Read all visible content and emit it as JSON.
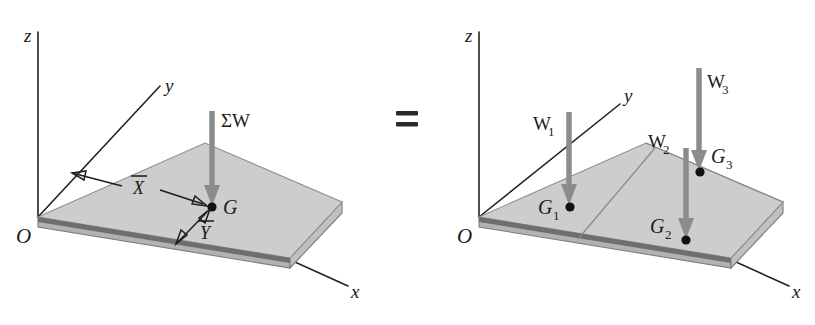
{
  "figure": {
    "caption_equals": "=",
    "left_diagram": {
      "name": "resultant-weight-diagram",
      "axes": {
        "x": "x",
        "y": "y",
        "z": "z",
        "origin": "O"
      },
      "centroid_label": "G",
      "force_label": "ΣW",
      "dimension_x_label": "X",
      "dimension_y_label": "Y",
      "dimension_x_overbar": true,
      "dimension_y_overbar": true
    },
    "right_diagram": {
      "name": "component-weights-diagram",
      "axes": {
        "x": "x",
        "y": "y",
        "z": "z",
        "origin": "O"
      },
      "forces": [
        {
          "label": "W",
          "sub": "1"
        },
        {
          "label": "W",
          "sub": "2"
        },
        {
          "label": "W",
          "sub": "3"
        }
      ],
      "centroids": [
        {
          "label": "G",
          "sub": "1"
        },
        {
          "label": "G",
          "sub": "2"
        },
        {
          "label": "G",
          "sub": "3"
        }
      ]
    },
    "colors": {
      "plate_top": "#cdcdcd",
      "plate_front": "#b2b2b2",
      "plate_right": "#c0c0c0",
      "arrow_gray": "#8c8c8c",
      "ink": "#1a1a1a",
      "background": "#ffffff"
    }
  }
}
